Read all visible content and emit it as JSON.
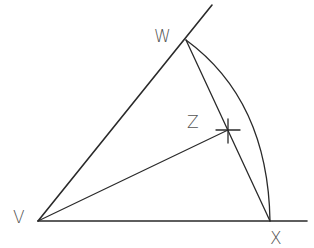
{
  "diagram": {
    "type": "geometric-construction",
    "colors": {
      "stroke": "#2a2a2a",
      "label": "#555555",
      "background": "#ffffff"
    },
    "points": {
      "V": {
        "label": "V",
        "x": 38,
        "y": 221
      },
      "W": {
        "label": "W",
        "x": 186,
        "y": 40
      },
      "X": {
        "label": "X",
        "x": 270,
        "y": 221
      },
      "Z": {
        "label": "Z",
        "x": 228,
        "y": 130
      }
    },
    "labels": {
      "V": "V",
      "W": "W",
      "X": "X",
      "Z": "Z"
    },
    "segments": [
      {
        "name": "ray-VW",
        "from": "V",
        "to": "beyond W"
      },
      {
        "name": "ray-VX",
        "from": "V",
        "to": "beyond X"
      },
      {
        "name": "segment-WX",
        "from": "W",
        "to": "X"
      },
      {
        "name": "segment-VZ",
        "from": "V",
        "to": "Z"
      },
      {
        "name": "arc-WX",
        "center": "V",
        "from": "W",
        "to": "X"
      }
    ]
  }
}
